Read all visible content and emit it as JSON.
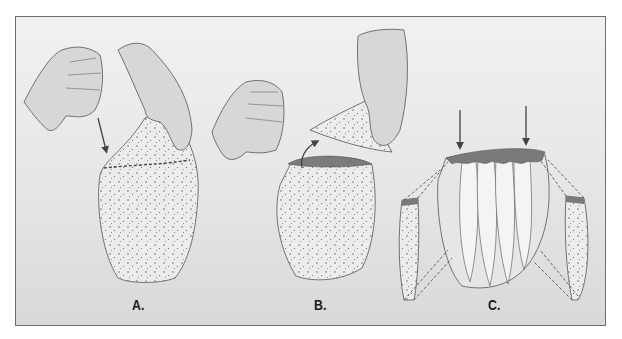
{
  "figure": {
    "panels": [
      {
        "id": "A",
        "label": "A.",
        "description": "Hands holding a dotted sac; dashed cut line across upper portion; arrow pointing to cut line"
      },
      {
        "id": "B",
        "label": "B.",
        "description": "Upper dotted flap lifted off by hand, exposing dark opening; curved arrow pointing up"
      },
      {
        "id": "C",
        "label": "C.",
        "description": "Segmented structure with dark scalloped top rim; two downward arrows; side segments connected by dashed lines"
      }
    ],
    "colors": {
      "background_light": "#f1f1f1",
      "background_dark": "#d9d9d9",
      "frame_border": "#6e6e6e",
      "skin": "#d6d6d6",
      "dotted_fill": "#e8e8e8",
      "dark_rim": "#7a7a7a",
      "arrow": "#444444"
    }
  }
}
